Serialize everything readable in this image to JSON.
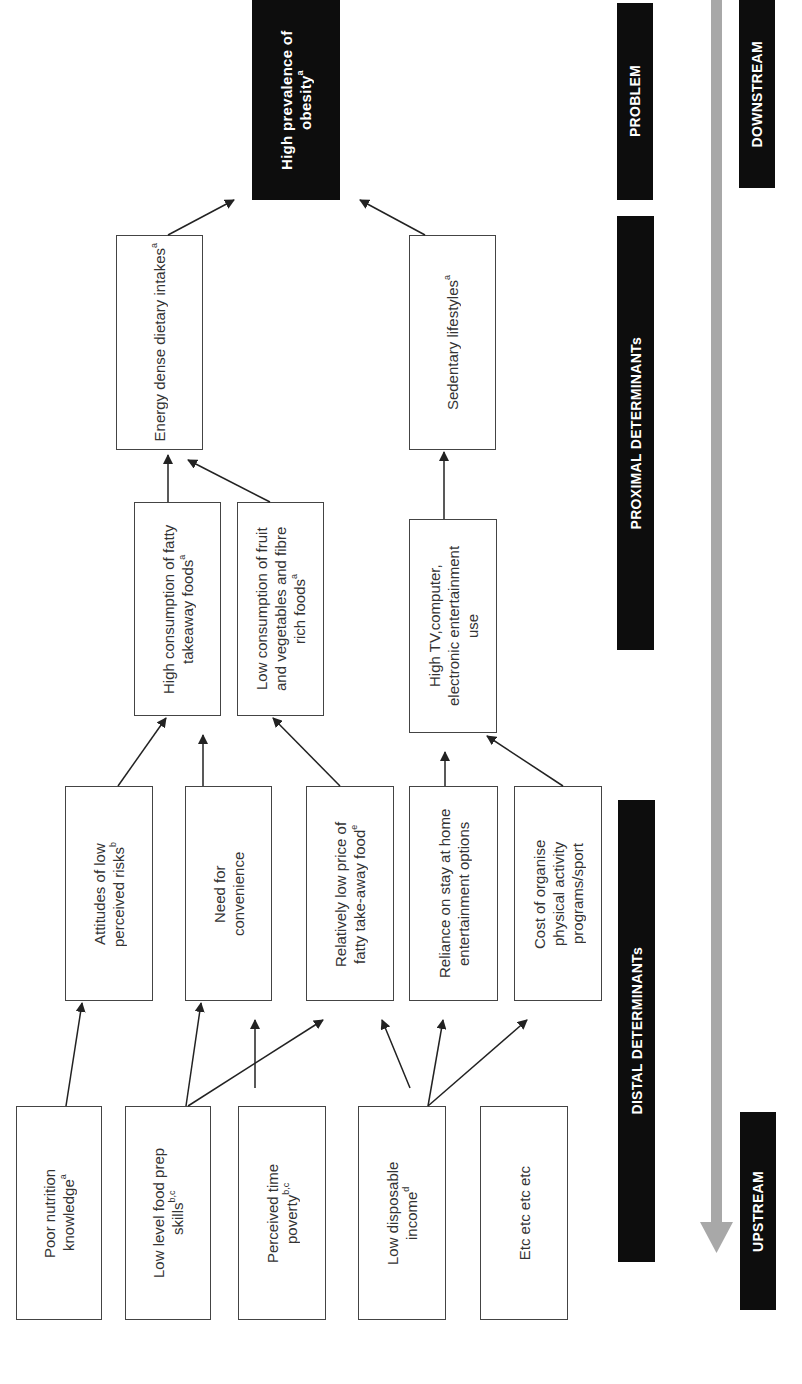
{
  "diagram": {
    "orientation": "rotated-90-ccw",
    "problem": {
      "text": "High prevalence of obesity",
      "sup": "a"
    },
    "proximal_level2": [
      {
        "id": "energy",
        "text": "Energy dense dietary intakes",
        "sup": "a"
      },
      {
        "id": "sedentary",
        "text": "Sedentary lifestyles",
        "sup": "a"
      }
    ],
    "proximal_level1": [
      {
        "id": "fatty",
        "text": "High consumption of fatty takeaway foods",
        "sup": "a"
      },
      {
        "id": "fruit",
        "text": "Low consumption of fruit and vegetables and fibre rich foods",
        "sup": "a"
      },
      {
        "id": "tv",
        "text": "High TV,computer, electronic entertainment use",
        "sup": ""
      }
    ],
    "distal_level2": [
      {
        "id": "attitudes",
        "text": "Attitudes of low perceived risks",
        "sup": "b"
      },
      {
        "id": "convenience",
        "text": "Need for convenience",
        "sup": ""
      },
      {
        "id": "price",
        "text": "Relatively low price of fatty take-away food",
        "sup": "e"
      },
      {
        "id": "reliance",
        "text": "Reliance on stay at home entertainment options",
        "sup": ""
      },
      {
        "id": "cost",
        "text": "Cost of organise physical activity programs/sport",
        "sup": ""
      }
    ],
    "distal_level1": [
      {
        "id": "nutrition",
        "text": "Poor nutrition knowledge",
        "sup": "a"
      },
      {
        "id": "foodprep",
        "text": "Low level food prep skills",
        "sup": "b,c"
      },
      {
        "id": "timepoverty",
        "text": "Perceived time poverty",
        "sup": "b,c"
      },
      {
        "id": "income",
        "text": "Low disposable income",
        "sup": "d"
      },
      {
        "id": "etc",
        "text": "Etc etc etc etc",
        "sup": ""
      }
    ],
    "category_bars": {
      "problem": "PROBLEM",
      "proximal": "PROXIMAL DETERMINANTs",
      "distal": "DISTAL DETERMINANTs"
    },
    "stream_labels": {
      "downstream": "DOWNSTREAM",
      "upstream": "UPSTREAM"
    },
    "colors": {
      "dark_fill": "#0d0d0d",
      "gray_arrow": "#a8a8a8",
      "box_border": "#444444",
      "arrow_line": "#222222"
    },
    "connections": [
      [
        "energy",
        "problem"
      ],
      [
        "sedentary",
        "problem"
      ],
      [
        "fatty",
        "energy"
      ],
      [
        "fruit",
        "energy"
      ],
      [
        "tv",
        "sedentary"
      ],
      [
        "attitudes",
        "fatty"
      ],
      [
        "convenience",
        "fatty"
      ],
      [
        "price",
        "fruit"
      ],
      [
        "reliance",
        "tv"
      ],
      [
        "cost",
        "tv"
      ],
      [
        "nutrition",
        "attitudes"
      ],
      [
        "foodprep",
        "convenience"
      ],
      [
        "foodprep",
        "price"
      ],
      [
        "timepoverty",
        "convenience"
      ],
      [
        "income",
        "price"
      ],
      [
        "income",
        "reliance"
      ],
      [
        "income",
        "cost"
      ]
    ]
  }
}
